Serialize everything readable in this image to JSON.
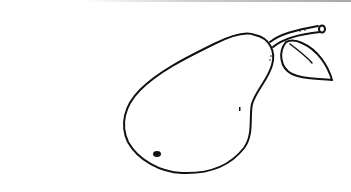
{
  "image": {
    "subject": "pear line drawing",
    "background": "#ffffff",
    "stroke": "#111111",
    "parts": [
      "pear-body",
      "stem",
      "leaf",
      "blossom-spot",
      "speck"
    ]
  }
}
